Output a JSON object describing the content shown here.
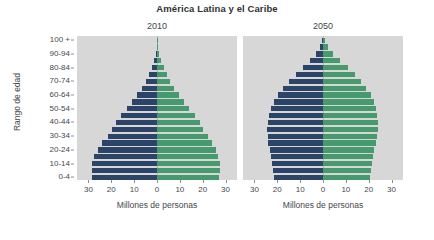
{
  "chart_data": {
    "type": "bar",
    "subtype": "population-pyramid",
    "title": "América Latina y el Caribe",
    "xlabel": "Millones de personas",
    "ylabel": "Rango de edad",
    "xlim": [
      -35,
      35
    ],
    "xticks": [
      30,
      20,
      10,
      0,
      10,
      20,
      30
    ],
    "xtick_labels": [
      "30",
      "20",
      "10",
      "0",
      "10",
      "20",
      "30"
    ],
    "grid": false,
    "legend": "none",
    "categories": [
      "0-4",
      "5-9",
      "10-14",
      "15-19",
      "20-24",
      "25-29",
      "30-34",
      "35-39",
      "40-44",
      "45-49",
      "50-54",
      "55-59",
      "60-64",
      "65-69",
      "70-74",
      "75-79",
      "80-84",
      "85-89",
      "90-94",
      "95-99",
      "100 +"
    ],
    "ytick_labels": [
      "0-4",
      "10-14",
      "20-24",
      "30-34",
      "40-44",
      "50-54",
      "60-64",
      "70-74",
      "80-84",
      "90-94",
      "100 +"
    ],
    "panels": [
      {
        "label": "2010",
        "series": [
          {
            "name": "male",
            "side": "left",
            "color": "#2c4468",
            "values": [
              28.5,
              28.6,
              28.4,
              27.4,
              26.0,
              24.0,
              21.6,
              19.6,
              18.0,
              15.6,
              13.2,
              10.8,
              8.6,
              6.6,
              5.0,
              3.6,
              2.4,
              1.3,
              0.6,
              0.2,
              0.05
            ]
          },
          {
            "name": "female",
            "side": "right",
            "color": "#479a6e",
            "values": [
              27.3,
              27.5,
              27.4,
              26.7,
              25.8,
              24.2,
              22.1,
              20.3,
              18.8,
              16.5,
              14.2,
              11.8,
              9.6,
              7.6,
              5.9,
              4.4,
              3.1,
              1.9,
              0.9,
              0.3,
              0.08
            ]
          }
        ]
      },
      {
        "label": "2050",
        "series": [
          {
            "name": "male",
            "side": "left",
            "color": "#2c4468",
            "values": [
              21.5,
              21.8,
              22.2,
              22.8,
              23.4,
              23.9,
              24.2,
              24.3,
              24.1,
              23.6,
              22.7,
              21.4,
              19.6,
              17.3,
              14.7,
              11.8,
              8.7,
              5.7,
              3.1,
              1.3,
              0.4
            ]
          },
          {
            "name": "female",
            "side": "right",
            "color": "#479a6e",
            "values": [
              20.6,
              20.9,
              21.3,
              21.9,
              22.5,
              23.1,
              23.6,
              23.9,
              23.9,
              23.7,
              23.1,
              22.2,
              20.8,
              18.9,
              16.6,
              13.9,
              10.8,
              7.5,
              4.4,
              2.0,
              0.7
            ]
          }
        ]
      }
    ]
  },
  "colors": {
    "male": "#2c4468",
    "female": "#479a6e",
    "plot_background": "#d7d7d7",
    "page_background": "#ffffff",
    "text": "#44484c"
  }
}
